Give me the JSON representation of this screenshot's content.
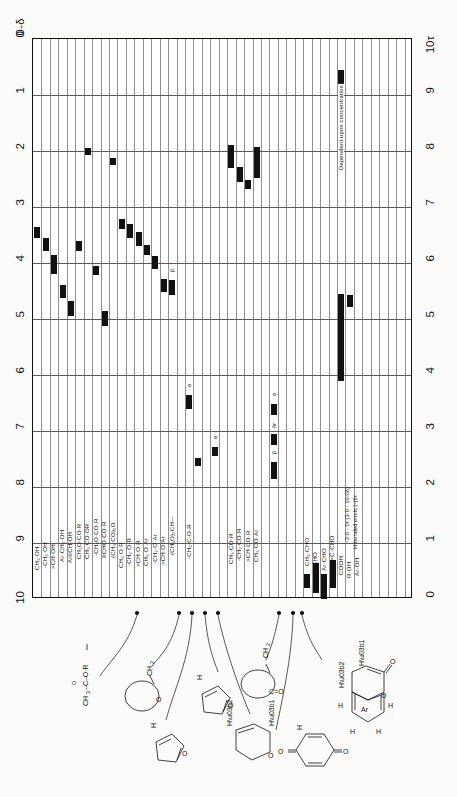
{
  "chart_data": {
    "type": "bar",
    "orientation": "rotated-90",
    "xlabel": "0-δ",
    "ylabel": "10τ",
    "left_axis": {
      "name": "0-δ",
      "ticks": [
        "0",
        "1",
        "2",
        "3",
        "4",
        "5",
        "6",
        "7",
        "8",
        "9",
        "10"
      ],
      "range": [
        0,
        10
      ]
    },
    "right_axis": {
      "name": "10τ",
      "ticks": [
        "10τ",
        "9",
        "8",
        "7",
        "6",
        "5",
        "4",
        "3",
        "2",
        "1",
        "0"
      ],
      "range": [
        10,
        0
      ]
    },
    "grid": true,
    "legend": "none",
    "categories": [
      "CH₃·OH",
      "-CH₂·OH",
      ">CH·OH",
      "Ar·CH₂·OH",
      "Ar≡CH·OH",
      "CH₃O·CO·R",
      "CH₃·CO·OR",
      "-CH₂O·CO·R",
      "≡CHO·CO·R",
      "(CH₃·CO)₂O",
      "CH₃·O·R",
      "-CH₂·O·R",
      ">CH·O·R",
      "CH₃·O·Ar",
      "-CH₂·O·Ar",
      ">CH·O·Ar",
      "(CH₃O)₂CH—",
      "-CH₂-C-O-R",
      "CH₃·CO·R",
      "-CH₂·CO·R",
      ">CH·CO·R",
      "CH₃·CO·Ar",
      "CH₃·CHO",
      "R·CHO",
      "Ar·CHO",
      "C=C-CHO",
      "COOH",
      "R·OH",
      "Ar·OH"
    ],
    "bars": [
      {
        "label": "CH₃·OH",
        "col": 1,
        "delta_from": 3.35,
        "delta_to": 3.55,
        "tau_from": 6.65,
        "tau_to": 6.45
      },
      {
        "label": "-CH₂·OH",
        "col": 2,
        "delta_from": 3.55,
        "delta_to": 3.78,
        "tau_from": 6.45,
        "tau_to": 6.22
      },
      {
        "label": ">CH·OH",
        "col": 3,
        "delta_from": 3.85,
        "delta_to": 4.2,
        "tau_from": 6.15,
        "tau_to": 5.8
      },
      {
        "label": "Ar·CH₂·OH",
        "col": 4,
        "delta_from": 4.4,
        "delta_to": 4.62,
        "tau_from": 5.6,
        "tau_to": 5.38
      },
      {
        "label": "Ar≡CH·OH",
        "col": 5,
        "delta_from": 4.68,
        "delta_to": 4.95,
        "tau_from": 5.32,
        "tau_to": 5.05
      },
      {
        "label": "CH₃O·CO·R",
        "col": 6,
        "delta_from": 3.6,
        "delta_to": 3.78,
        "tau_from": 6.4,
        "tau_to": 6.22
      },
      {
        "label": "CH₃·CO·OR",
        "col": 7,
        "delta_from": 1.95,
        "delta_to": 2.08,
        "tau_from": 8.05,
        "tau_to": 7.92
      },
      {
        "label": "-CH₂O·CO·R",
        "col": 8,
        "delta_from": 4.05,
        "delta_to": 4.22,
        "tau_from": 5.95,
        "tau_to": 5.78
      },
      {
        "label": "≡CHO·CO·R",
        "col": 9,
        "delta_from": 4.85,
        "delta_to": 5.12,
        "tau_from": 5.15,
        "tau_to": 4.88
      },
      {
        "label": "(CH₃·CO)₂O",
        "col": 10,
        "delta_from": 2.12,
        "delta_to": 2.25,
        "tau_from": 7.88,
        "tau_to": 7.75
      },
      {
        "label": "CH₃·O·R",
        "col": 11,
        "delta_from": 3.22,
        "delta_to": 3.4,
        "tau_from": 6.78,
        "tau_to": 6.6
      },
      {
        "label": "-CH₂·O·R",
        "col": 12,
        "delta_from": 3.3,
        "delta_to": 3.55,
        "tau_from": 6.7,
        "tau_to": 6.45
      },
      {
        "label": ">CH·O·R",
        "col": 13,
        "delta_from": 3.45,
        "delta_to": 3.7,
        "tau_from": 6.55,
        "tau_to": 6.3
      },
      {
        "label": "CH₃·O·Ar",
        "col": 14,
        "delta_from": 3.68,
        "delta_to": 3.85,
        "tau_from": 6.32,
        "tau_to": 6.15
      },
      {
        "label": "-CH₂·O·Ar",
        "col": 15,
        "delta_from": 3.88,
        "delta_to": 4.1,
        "tau_from": 6.12,
        "tau_to": 5.9
      },
      {
        "label": ">CH·O·Ar",
        "col": 16,
        "delta_from": 4.28,
        "delta_to": 4.52,
        "tau_from": 5.72,
        "tau_to": 5.48
      },
      {
        "label": "(CH₃O)₂CH—",
        "col": 17,
        "delta_from": 4.3,
        "delta_to": 4.58,
        "tau_from": 5.7,
        "tau_to": 5.42,
        "tag": "β"
      },
      {
        "label": "-CH₂-C-O-R",
        "col": 19,
        "delta_from": 6.35,
        "delta_to": 6.6,
        "tau_from": 3.65,
        "tau_to": 3.4,
        "tag": "α"
      },
      {
        "label": "CH₃·CO·R",
        "col": 24,
        "delta_from": 1.9,
        "delta_to": 2.3,
        "tau_from": 8.1,
        "tau_to": 7.7
      },
      {
        "label": "-CH₂·CO·R",
        "col": 25,
        "delta_from": 2.28,
        "delta_to": 2.55,
        "tau_from": 7.72,
        "tau_to": 7.45
      },
      {
        "label": ">CH·CO·R",
        "col": 26,
        "delta_from": 2.52,
        "delta_to": 2.68,
        "tau_from": 7.48,
        "tau_to": 7.32
      },
      {
        "label": "CH₃·CO·Ar",
        "col": 27,
        "delta_from": 1.92,
        "delta_to": 2.48,
        "tau_from": 8.08,
        "tau_to": 7.52
      },
      {
        "label": "CH₃·CHO",
        "col": 33,
        "delta_from": 9.55,
        "delta_to": 9.8,
        "tau_from": 0.45,
        "tau_to": 0.2
      },
      {
        "label": "R·CHO",
        "col": 34,
        "delta_from": 9.35,
        "delta_to": 9.9,
        "tau_from": 0.65,
        "tau_to": 0.1
      },
      {
        "label": "Ar·CHO",
        "col": 35,
        "delta_from": 9.55,
        "delta_to": 10.0,
        "tau_from": 0.45,
        "tau_to": 0.0
      },
      {
        "label": "C=C-CHO",
        "col": 36,
        "delta_from": 9.3,
        "delta_to": 9.8,
        "tau_from": 0.7,
        "tau_to": 0.2
      },
      {
        "label": "COOH",
        "col": 37,
        "delta_from": 0.55,
        "delta_to": 2.18,
        "tau_from": 9.45,
        "tau_to": 7.82,
        "note": "Dependent upon concentration"
      },
      {
        "label": "COOH-low",
        "col": 37,
        "delta_from": 4.55,
        "delta_to": 6.1,
        "tau_from": 5.45,
        "tau_to": 3.9
      },
      {
        "label": "R·OH",
        "col": 38,
        "delta_from": 4.58,
        "delta_to": 4.78,
        "tau_from": 5.42,
        "tau_to": 5.22
      },
      {
        "label": "Ar·OH-extra",
        "col": 20,
        "delta_from": 7.48,
        "delta_to": 7.62,
        "tau_from": 2.52,
        "tau_to": 2.38
      },
      {
        "label": "alpha-furan",
        "col": 22,
        "delta_from": 7.28,
        "delta_to": 7.45,
        "tau_from": 2.72,
        "tau_to": 2.55,
        "tag": "α"
      },
      {
        "label": "beta-aromatic",
        "col": 29,
        "delta_from": 6.52,
        "delta_to": 6.72,
        "tau_from": 3.48,
        "tau_to": 3.28,
        "tag": "α"
      },
      {
        "label": "Ar-H",
        "col": 29,
        "delta_from": 7.05,
        "delta_to": 7.25,
        "tau_from": 2.95,
        "tau_to": 2.75,
        "tag": "Ar"
      },
      {
        "label": "beta-H",
        "col": 29,
        "delta_from": 7.55,
        "delta_to": 7.85,
        "tau_from": 2.45,
        "tau_to": 2.15,
        "tag": "β"
      }
    ],
    "annotations": [
      {
        "text": "Dependent upon concentration",
        "for": "COOH"
      },
      {
        "text": "-3·0 - 0τ (3·0 - 10·0δ)",
        "for": "COOH"
      },
      {
        "text": "H-bonded enols (-)6τ",
        "for": "R·OH"
      }
    ]
  },
  "axes": {
    "left_title": "0-δ",
    "right_title": "10τ",
    "left_ticks": [
      "0",
      "1",
      "2",
      "3",
      "4",
      "5",
      "6",
      "7",
      "8",
      "9",
      "10"
    ],
    "right_ticks": [
      "10τ",
      "9",
      "8",
      "7",
      "6",
      "5",
      "4",
      "3",
      "2",
      "1",
      "0"
    ]
  },
  "columns": [
    {
      "i": 1,
      "label": "CH₃·OH"
    },
    {
      "i": 2,
      "label": "-CH₂·OH"
    },
    {
      "i": 3,
      "label": ">CH·OH"
    },
    {
      "i": 4,
      "label": "Ar·CH₂·OH"
    },
    {
      "i": 5,
      "label": "Ar≡CH·OH"
    },
    {
      "i": 6,
      "label": "CH₃O·CO·R"
    },
    {
      "i": 7,
      "label": "CH₃·CO·OR"
    },
    {
      "i": 8,
      "label": "-CH₂O·CO·R"
    },
    {
      "i": 9,
      "label": "≡CHO·CO·R"
    },
    {
      "i": 10,
      "label": "(CH₃·CO)₂O"
    },
    {
      "i": 11,
      "label": "CH₃·O·R"
    },
    {
      "i": 12,
      "label": "-CH₂·O·R"
    },
    {
      "i": 13,
      "label": ">CH·O·R"
    },
    {
      "i": 14,
      "label": "CH₃·O·Ar"
    },
    {
      "i": 15,
      "label": "-CH₂·O·Ar"
    },
    {
      "i": 16,
      "label": ">CH·O·Ar"
    },
    {
      "i": 17,
      "label": "(CH₃O)₂CH—"
    },
    {
      "i": 19,
      "label": "-CH₂-C-O-R"
    },
    {
      "i": 24,
      "label": "CH₃·CO·R"
    },
    {
      "i": 25,
      "label": "-CH₂·CO·R"
    },
    {
      "i": 26,
      "label": ">CH·CO·R"
    },
    {
      "i": 27,
      "label": "CH₃·CO·Ar"
    },
    {
      "i": 33,
      "label": "CH₃·CHO"
    },
    {
      "i": 34,
      "label": "R·CHO"
    },
    {
      "i": 35,
      "label": "Ar·CHO"
    },
    {
      "i": 36,
      "label": "C=C-CHO"
    },
    {
      "i": 37,
      "label": "COOH"
    },
    {
      "i": 38,
      "label": "R·OH"
    },
    {
      "i": 39,
      "label": "Ar·OH"
    }
  ],
  "notes": {
    "conc": "Dependent upon concentration",
    "cooh_range": "-3·0 - 0τ (3·0 - 10·0δ)",
    "enols": "H-bonded enols (-)6τ"
  },
  "structures": {
    "ester": {
      "ch3": "CH₃",
      "tail": "–C–O·R"
    },
    "lactone": {
      "ch2": "CH₂",
      "o": "O"
    },
    "furan_a": {
      "h": "H",
      "o": "O"
    },
    "furan_b": {
      "h": "H",
      "o": "O"
    },
    "pyran": {
      "hb": "Hβ",
      "ha": "Hα",
      "o": "O"
    },
    "ketone_ring": {
      "ch2": "CH₂",
      "co": "C=O"
    },
    "quinone": {
      "h": "H",
      "o1": "O",
      "o2": "O"
    },
    "coumarin": {
      "ha": "Hα",
      "hb": "Hβ",
      "ar": "Ar",
      "h1": "H",
      "h2": "H",
      "h3": "H",
      "h4": "H",
      "o_ring": "O",
      "o_carbonyl": "O"
    }
  },
  "colors": {
    "ink": "#111111",
    "grid": "#8e8e8e",
    "major_grid": "#5a5a5a",
    "paper": "#ffffff"
  }
}
